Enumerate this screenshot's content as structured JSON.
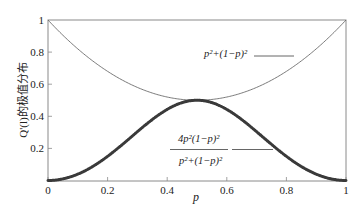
{
  "chart_data": {
    "type": "line",
    "title": "",
    "xlabel": "p",
    "ylabel": "Q'(l)的极值分布",
    "xlim": [
      0,
      1
    ],
    "ylim": [
      0,
      1
    ],
    "grid": false,
    "legend_position": "inline annotations",
    "x_ticks": [
      "0",
      "0.2",
      "0.4",
      "0.6",
      "0.8",
      "1"
    ],
    "y_ticks": [
      "0",
      "0.2",
      "0.4",
      "0.6",
      "0.8",
      "1"
    ],
    "x": [
      0,
      0.1,
      0.2,
      0.3,
      0.4,
      0.5,
      0.6,
      0.7,
      0.8,
      0.9,
      1.0
    ],
    "series": [
      {
        "name": "p²+(1−p)²",
        "style": "thin line",
        "color": "#6b6b6b",
        "values": [
          1.0,
          0.82,
          0.68,
          0.58,
          0.52,
          0.5,
          0.52,
          0.58,
          0.68,
          0.82,
          1.0
        ]
      },
      {
        "name": "4p²(1−p)² / (p²+(1−p)²)",
        "style": "thick marker line",
        "color": "#3a3a3a",
        "values": [
          0.0,
          0.0395,
          0.1506,
          0.3041,
          0.4431,
          0.5,
          0.4431,
          0.3041,
          0.1506,
          0.0395,
          0.0
        ]
      }
    ],
    "annotations": [
      {
        "text": "p²+(1−p)²",
        "target_series": 0
      },
      {
        "numerator": "4p²(1−p)²",
        "denominator": "p²+(1−p)²",
        "target_series": 1
      }
    ]
  },
  "labels": {
    "xlabel": "p",
    "ylabel": "Q'(l)的极值分布",
    "xticks": [
      "0",
      "0.2",
      "0.4",
      "0.6",
      "0.8",
      "1"
    ],
    "yticks": [
      "0",
      "0.2",
      "0.4",
      "0.6",
      "0.8",
      "1"
    ],
    "upper_formula": "p²+(1−p)²",
    "lower_numerator": "4p²(1−p)²",
    "lower_denominator": "p²+(1−p)²"
  },
  "colors": {
    "axis": "#8a8a8a",
    "thin_curve": "#6b6b6b",
    "thick_curve": "#3a3a3a"
  }
}
